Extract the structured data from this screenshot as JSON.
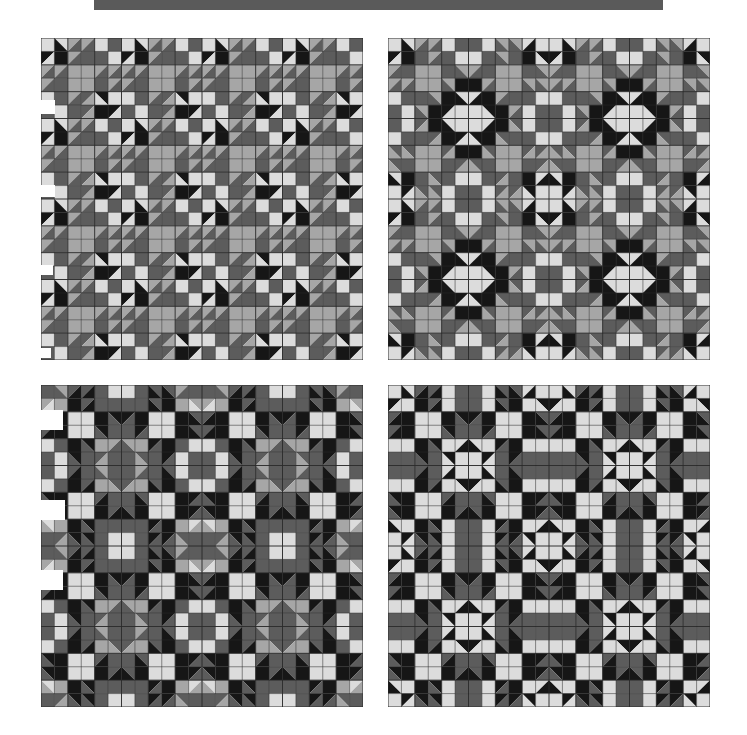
{
  "header": {
    "bar_color": "#5a5a5a"
  },
  "palette": {
    "L": "#dcdcdc",
    "M": "#a6a6a6",
    "D": "#5c5c5c",
    "K": "#161616",
    "line": "#2a2a2a"
  },
  "panels": [
    {
      "id": "quilt-top-left",
      "x": 41,
      "y": 38,
      "size": 322,
      "cells": 24,
      "tile_size": 6,
      "symmetric": false,
      "tile": [
        [
          "L",
          "LK\\",
          "MD/",
          "MD/",
          "L",
          "D"
        ],
        [
          "KL/",
          "K",
          "MD/",
          "D",
          "D",
          "L"
        ],
        [
          "MD/",
          "MD/",
          "M",
          "M",
          "MD/",
          "MD/"
        ],
        [
          "MD/",
          "D",
          "M",
          "M",
          "D",
          "MD/"
        ],
        [
          "L",
          "D",
          "MD/",
          "DM/",
          "KL\\",
          "L"
        ],
        [
          "D",
          "L",
          "D",
          "DM/",
          "K",
          "KL/"
        ]
      ]
    },
    {
      "id": "quilt-top-right",
      "x": 388,
      "y": 38,
      "size": 322,
      "cells": 24,
      "tile_size": 12,
      "symmetric": true,
      "quarter": [
        [
          "L",
          "LK\\",
          "MD/",
          "MD/",
          "L",
          "D"
        ],
        [
          "KL/",
          "K",
          "D",
          "MD/",
          "D",
          "L"
        ],
        [
          "MD/",
          "D",
          "M",
          "M",
          "D",
          "MD\\"
        ],
        [
          "MD/",
          "MD/",
          "M",
          "M",
          "MD\\",
          "K"
        ],
        [
          "L",
          "D",
          "D",
          "MD\\",
          "K",
          "LK\\"
        ],
        [
          "D",
          "L",
          "MD\\",
          "K",
          "KL/",
          "L"
        ]
      ]
    },
    {
      "id": "quilt-bottom-left",
      "x": 41,
      "y": 385,
      "size": 322,
      "cells": 24,
      "tile_size": 12,
      "symmetric": true,
      "quarter": [
        [
          "D",
          "MD\\",
          "DK/",
          "DK/",
          "D",
          "L"
        ],
        [
          "ML/",
          "M",
          "K",
          "DK/",
          "D",
          "D"
        ],
        [
          "DK/",
          "K",
          "L",
          "L",
          "K",
          "KD\\"
        ],
        [
          "DK/",
          "K",
          "L",
          "L",
          "KD\\",
          "D"
        ],
        [
          "L",
          "D",
          "K",
          "KD\\",
          "M",
          "MD/"
        ],
        [
          "D",
          "L",
          "KD\\",
          "D",
          "DM/",
          "D"
        ]
      ]
    },
    {
      "id": "quilt-bottom-right",
      "x": 388,
      "y": 385,
      "size": 322,
      "cells": 24,
      "tile_size": 12,
      "symmetric": true,
      "quarter": [
        [
          "L",
          "LK\\",
          "DK/",
          "DK/",
          "L",
          "D"
        ],
        [
          "KL/",
          "L",
          "K",
          "DK/",
          "L",
          "D"
        ],
        [
          "DK/",
          "K",
          "L",
          "L",
          "K",
          "KD\\"
        ],
        [
          "DK/",
          "K",
          "L",
          "L",
          "KD\\",
          "D"
        ],
        [
          "L",
          "L",
          "K",
          "KD\\",
          "L",
          "LK/"
        ],
        [
          "D",
          "D",
          "KD\\",
          "D",
          "KL\\",
          "L"
        ]
      ]
    }
  ],
  "notches": [
    {
      "x": 41,
      "y": 100,
      "w": 14,
      "h": 14
    },
    {
      "x": 41,
      "y": 185,
      "w": 14,
      "h": 12
    },
    {
      "x": 41,
      "y": 265,
      "w": 12,
      "h": 10
    },
    {
      "x": 41,
      "y": 348,
      "w": 10,
      "h": 10
    },
    {
      "x": 41,
      "y": 410,
      "w": 22,
      "h": 20
    },
    {
      "x": 41,
      "y": 500,
      "w": 24,
      "h": 20
    },
    {
      "x": 41,
      "y": 570,
      "w": 22,
      "h": 20
    }
  ]
}
